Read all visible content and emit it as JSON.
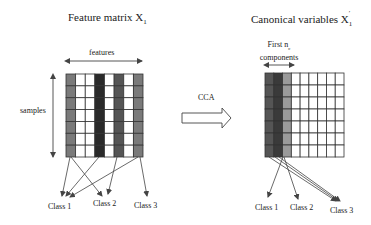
{
  "left_panel": {
    "title": "Feature matrix X",
    "title_sub": "1",
    "axis_top_label": "features",
    "axis_left_label": "samples",
    "columns": 8,
    "rows": 7,
    "column_fills": [
      "#7a7a7a",
      "#ffffff",
      "#ffffff",
      "#2a2a2a",
      "#ffffff",
      "#555555",
      "#ffffff",
      "#7a7a7a"
    ],
    "classes": [
      "Class 1",
      "Class 2",
      "Class 3"
    ]
  },
  "transform": {
    "label": "CCA"
  },
  "right_panel": {
    "title": "Canonical variables X",
    "title_prime": "′",
    "title_sub": "1",
    "axis_top_label_line1": "First n",
    "axis_top_label_sub": "c",
    "axis_top_label_line2": "components",
    "columns": 9,
    "rows": 7,
    "column_fills": [
      "#555555",
      "#3a3a3a",
      "#9a9a9a",
      "#ffffff",
      "#ffffff",
      "#ffffff",
      "#ffffff",
      "#ffffff",
      "#ffffff"
    ],
    "classes": [
      "Class 1",
      "Class 2",
      "Class 3"
    ]
  },
  "colors": {
    "grid_line": "#333333",
    "arrow": "#444444"
  }
}
